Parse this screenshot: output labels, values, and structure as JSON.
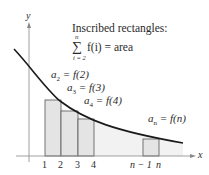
{
  "diagram": {
    "axes": {
      "x_label": "x",
      "y_label": "y"
    },
    "title_text": "Inscribed rectangles:",
    "sum": {
      "symbol": "∑",
      "upper": "n",
      "lower": "i = 2",
      "expr": "f(i) = area"
    },
    "annotations": [
      {
        "name": "a2",
        "var": "a",
        "sub": "2",
        "rhs": "= f(2)"
      },
      {
        "name": "a3",
        "var": "a",
        "sub": "3",
        "rhs": "= f(3)"
      },
      {
        "name": "a4",
        "var": "a",
        "sub": "4",
        "rhs": "= f(4)"
      },
      {
        "name": "an",
        "var": "a",
        "sub": "n",
        "rhs": "= f(n)"
      }
    ],
    "x_ticks": [
      "1",
      "2",
      "3",
      "4",
      "n − 1",
      "n"
    ],
    "colors": {
      "curve": "#1a1a1a",
      "rect_fill": "#e6e6e6",
      "rect_stroke": "#555555",
      "area_fill": "#f0f0f0",
      "axis": "#888888"
    }
  }
}
